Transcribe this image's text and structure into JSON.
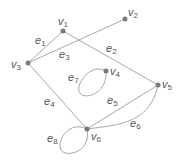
{
  "diagram": {
    "type": "graph",
    "colors": {
      "edge": "#a8a8a8",
      "vertex": "#7a7a7a",
      "label": "#555555"
    },
    "vertices": [
      {
        "id": "v1",
        "base": "v",
        "sub": "1",
        "x": 63,
        "y": 31
      },
      {
        "id": "v2",
        "base": "v",
        "sub": "2",
        "x": 125,
        "y": 19
      },
      {
        "id": "v3",
        "base": "v",
        "sub": "3",
        "x": 28,
        "y": 63
      },
      {
        "id": "v4",
        "base": "v",
        "sub": "4",
        "x": 106,
        "y": 71
      },
      {
        "id": "v5",
        "base": "v",
        "sub": "5",
        "x": 158,
        "y": 85
      },
      {
        "id": "v6",
        "base": "v",
        "sub": "6",
        "x": 87,
        "y": 129
      }
    ],
    "edges": [
      {
        "id": "e1",
        "base": "e",
        "sub": "1",
        "from": "v3",
        "to": "v1"
      },
      {
        "id": "e2",
        "base": "e",
        "sub": "2",
        "from": "v1",
        "to": "v5"
      },
      {
        "id": "e3",
        "base": "e",
        "sub": "3",
        "from": "v3",
        "to": "v2"
      },
      {
        "id": "e4",
        "base": "e",
        "sub": "4",
        "from": "v3",
        "to": "v6"
      },
      {
        "id": "e5",
        "base": "e",
        "sub": "5",
        "from": "v6",
        "to": "v5"
      },
      {
        "id": "e6",
        "base": "e",
        "sub": "6",
        "from": "v6",
        "to": "v5",
        "curved": true
      },
      {
        "id": "e7",
        "base": "e",
        "sub": "7",
        "from": "v4",
        "to": "v4",
        "loop": true
      },
      {
        "id": "e8",
        "base": "e",
        "sub": "8",
        "from": "v6",
        "to": "v6",
        "loop": true
      }
    ]
  }
}
